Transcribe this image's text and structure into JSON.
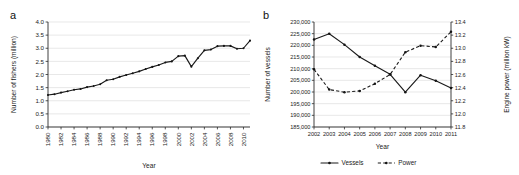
{
  "figure": {
    "panel_a_label": "a",
    "panel_b_label": "b"
  },
  "chart_data": [
    {
      "id": "fishers",
      "panel": "a",
      "type": "line",
      "title": "",
      "xlabel": "Year",
      "ylabel": "Number of fishers (million)",
      "xlim": [
        1980,
        2011
      ],
      "ylim": [
        0.0,
        4.0
      ],
      "yticks": [
        "0.0",
        "0.5",
        "1.0",
        "1.5",
        "2.0",
        "2.5",
        "3.0",
        "3.5",
        "4.0"
      ],
      "ytick_values": [
        0.0,
        0.5,
        1.0,
        1.5,
        2.0,
        2.5,
        3.0,
        3.5,
        4.0
      ],
      "xticks": [
        "1980",
        "1982",
        "1984",
        "1986",
        "1988",
        "1990",
        "1992",
        "1994",
        "1996",
        "1998",
        "2000",
        "2002",
        "2004",
        "2006",
        "2008",
        "2010"
      ],
      "xtick_values": [
        1980,
        1982,
        1984,
        1986,
        1988,
        1990,
        1992,
        1994,
        1996,
        1998,
        2000,
        2002,
        2004,
        2006,
        2008,
        2010
      ],
      "grid": true,
      "legend": null,
      "x": [
        1980,
        1981,
        1982,
        1983,
        1984,
        1985,
        1986,
        1987,
        1988,
        1989,
        1990,
        1991,
        1992,
        1993,
        1994,
        1995,
        1996,
        1997,
        1998,
        1999,
        2000,
        2001,
        2002,
        2003,
        2004,
        2005,
        2006,
        2007,
        2008,
        2009,
        2010,
        2011
      ],
      "values": [
        1.22,
        1.25,
        1.31,
        1.36,
        1.42,
        1.45,
        1.52,
        1.56,
        1.63,
        1.78,
        1.82,
        1.91,
        1.98,
        2.05,
        2.12,
        2.21,
        2.29,
        2.36,
        2.46,
        2.5,
        2.7,
        2.72,
        2.3,
        2.62,
        2.92,
        2.95,
        3.08,
        3.09,
        3.09,
        2.98,
        3.0,
        3.29
      ],
      "series_values_note": "one point per year 1980-2011",
      "y_by_year": {
        "1980": 1.22,
        "1981": 1.25,
        "1982": 1.31,
        "1983": 1.36,
        "1984": 1.42,
        "1985": 1.45,
        "1986": 1.52,
        "1987": 1.56,
        "1988": 1.63,
        "1989": 1.78,
        "1990": 1.82,
        "1991": 1.91,
        "1992": 1.98,
        "1993": 2.05,
        "1994": 2.12,
        "1995": 2.21,
        "1996": 2.29,
        "1997": 2.36,
        "1998": 2.46,
        "1999": 2.5,
        "2000": 2.7,
        "2001": 2.72,
        "2002": 2.3,
        "2003": 2.62,
        "2004": 2.92,
        "2005": 2.95,
        "2006": 3.08,
        "2007": 3.09,
        "2008": 3.09,
        "2009": 2.98,
        "2010": 3.0,
        "2011": 3.29
      }
    },
    {
      "id": "vessels-power",
      "panel": "b",
      "type": "line",
      "title": "",
      "xlabel": "Year",
      "ylabel": "Number of vessels",
      "y2label": "Engine power (million kW)",
      "xlim": [
        2002,
        2011
      ],
      "ylim": [
        185000,
        230000
      ],
      "y2lim": [
        11.8,
        13.4
      ],
      "yticks": [
        "185,000",
        "190,000",
        "195,000",
        "200,000",
        "205,000",
        "210,000",
        "215,000",
        "220,000",
        "225,000",
        "230,000"
      ],
      "ytick_values": [
        185000,
        190000,
        195000,
        200000,
        205000,
        210000,
        215000,
        220000,
        225000,
        230000
      ],
      "y2ticks": [
        "11.8",
        "12.0",
        "12.2",
        "12.4",
        "12.6",
        "12.8",
        "13.0",
        "13.2",
        "13.4"
      ],
      "y2tick_values": [
        11.8,
        12.0,
        12.2,
        12.4,
        12.6,
        12.8,
        13.0,
        13.2,
        13.4
      ],
      "xticks": [
        "2002",
        "2003",
        "2004",
        "2005",
        "2006",
        "2007",
        "2008",
        "2009",
        "2010",
        "2011"
      ],
      "xtick_values": [
        2002,
        2003,
        2004,
        2005,
        2006,
        2007,
        2008,
        2009,
        2010,
        2011
      ],
      "grid": true,
      "legend_position": "bottom",
      "x": [
        2002,
        2003,
        2004,
        2005,
        2006,
        2007,
        2008,
        2009,
        2010,
        2011
      ],
      "series": [
        {
          "name": "Vessels",
          "axis": "left",
          "style": "solid",
          "values": [
            222500,
            225000,
            220300,
            215000,
            211200,
            207600,
            199900,
            207200,
            204800,
            201700
          ]
        },
        {
          "name": "Power",
          "axis": "right",
          "style": "dashed",
          "values": [
            12.68,
            12.37,
            12.33,
            12.35,
            12.46,
            12.6,
            12.94,
            13.04,
            13.02,
            13.25
          ]
        }
      ]
    }
  ],
  "legend": {
    "items": [
      {
        "label": "Vessels",
        "style": "solid"
      },
      {
        "label": "Power",
        "style": "dashed"
      }
    ]
  }
}
